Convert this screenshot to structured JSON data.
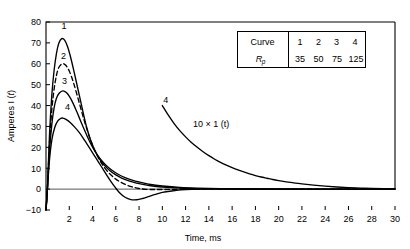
{
  "chart_data": {
    "type": "line",
    "title": "",
    "xlabel": "Time, ms",
    "ylabel": "Amperes I (t)",
    "xlim": [
      0,
      30
    ],
    "ylim": [
      -10,
      80
    ],
    "xticks": [
      2,
      4,
      6,
      8,
      10,
      12,
      14,
      16,
      18,
      20,
      22,
      24,
      26,
      28,
      30
    ],
    "yticks": [
      -10,
      0,
      10,
      20,
      30,
      40,
      50,
      60,
      70,
      80
    ],
    "grid": false,
    "legend": "none",
    "zero_line": true,
    "annotations": [
      {
        "name": "magnified-curve-label",
        "text": "4",
        "x": 10.3,
        "y": 41
      },
      {
        "name": "magnification-note",
        "text": "10 × 1 (t)",
        "x": 14.2,
        "y": 29.5
      }
    ],
    "series": [
      {
        "name": "1",
        "label": "1",
        "Rp": 35,
        "style": "solid",
        "label_x": 1.55,
        "label_y": 76.5,
        "peak_x": 1.35,
        "peak_y": 72,
        "points": [
          [
            0,
            -10
          ],
          [
            0.12,
            0
          ],
          [
            0.3,
            26
          ],
          [
            0.5,
            45
          ],
          [
            0.7,
            57
          ],
          [
            0.9,
            65
          ],
          [
            1.1,
            69.8
          ],
          [
            1.35,
            72
          ],
          [
            1.6,
            71.3
          ],
          [
            1.85,
            68.3
          ],
          [
            2.1,
            63.5
          ],
          [
            2.4,
            56.5
          ],
          [
            2.7,
            49
          ],
          [
            3.0,
            41.5
          ],
          [
            3.3,
            34
          ],
          [
            3.5,
            29.5
          ],
          [
            3.8,
            24
          ],
          [
            4.2,
            18.5
          ],
          [
            4.6,
            14.5
          ],
          [
            5.0,
            11.5
          ],
          [
            5.5,
            8.8
          ],
          [
            6.0,
            6.8
          ],
          [
            6.5,
            5.3
          ],
          [
            7.0,
            4.2
          ],
          [
            7.5,
            3.3
          ],
          [
            8.0,
            2.6
          ],
          [
            9.0,
            1.6
          ],
          [
            10.0,
            1.0
          ],
          [
            11.5,
            0.5
          ],
          [
            13.0,
            0.25
          ],
          [
            15.0,
            0.1
          ],
          [
            18.0,
            0.03
          ],
          [
            22.0,
            0
          ],
          [
            30.0,
            0
          ]
        ]
      },
      {
        "name": "2",
        "label": "2",
        "Rp": 50,
        "style": "dashed",
        "label_x": 1.5,
        "label_y": 62.5,
        "peak_x": 1.4,
        "peak_y": 60,
        "points": [
          [
            0,
            -10
          ],
          [
            0.12,
            0
          ],
          [
            0.3,
            22
          ],
          [
            0.5,
            38
          ],
          [
            0.7,
            48
          ],
          [
            0.9,
            54.5
          ],
          [
            1.1,
            58.2
          ],
          [
            1.4,
            60
          ],
          [
            1.7,
            59.3
          ],
          [
            2.0,
            56.5
          ],
          [
            2.3,
            52
          ],
          [
            2.6,
            46.5
          ],
          [
            2.9,
            40.5
          ],
          [
            3.2,
            34.5
          ],
          [
            3.5,
            29
          ],
          [
            3.8,
            24
          ],
          [
            4.2,
            18.5
          ],
          [
            4.6,
            14
          ],
          [
            5.0,
            10.5
          ],
          [
            5.5,
            7.2
          ],
          [
            6.0,
            4.8
          ],
          [
            6.5,
            3.1
          ],
          [
            7.0,
            1.8
          ],
          [
            7.5,
            0.9
          ],
          [
            8.0,
            0.3
          ],
          [
            8.6,
            -0.1
          ],
          [
            9.4,
            -0.2
          ],
          [
            10.5,
            -0.15
          ],
          [
            12.0,
            -0.05
          ],
          [
            14.0,
            0
          ],
          [
            20.0,
            0
          ],
          [
            30.0,
            0
          ]
        ]
      },
      {
        "name": "3",
        "label": "3",
        "Rp": 75,
        "style": "solid",
        "label_x": 1.6,
        "label_y": 50.5,
        "peak_x": 1.45,
        "peak_y": 47,
        "points": [
          [
            0,
            -10
          ],
          [
            0.12,
            0
          ],
          [
            0.3,
            18
          ],
          [
            0.5,
            31
          ],
          [
            0.7,
            39
          ],
          [
            0.9,
            43.5
          ],
          [
            1.15,
            46
          ],
          [
            1.45,
            47
          ],
          [
            1.75,
            46.2
          ],
          [
            2.05,
            44
          ],
          [
            2.35,
            40.8
          ],
          [
            2.65,
            37
          ],
          [
            2.95,
            33
          ],
          [
            3.25,
            29
          ],
          [
            3.55,
            25.2
          ],
          [
            3.9,
            21.2
          ],
          [
            4.3,
            17.3
          ],
          [
            4.7,
            14.2
          ],
          [
            5.2,
            11.2
          ],
          [
            5.7,
            8.9
          ],
          [
            6.2,
            7.1
          ],
          [
            6.8,
            5.5
          ],
          [
            7.4,
            4.3
          ],
          [
            8.0,
            3.4
          ],
          [
            9.0,
            2.2
          ],
          [
            10.0,
            1.5
          ],
          [
            11.5,
            0.8
          ],
          [
            13.0,
            0.45
          ],
          [
            15.0,
            0.2
          ],
          [
            18.0,
            0.06
          ],
          [
            22.0,
            0
          ],
          [
            30.0,
            0
          ]
        ]
      },
      {
        "name": "4",
        "label": "4",
        "Rp": 125,
        "style": "solid",
        "label_x": 1.85,
        "label_y": 38,
        "peak_x": 1.4,
        "peak_y": 34,
        "points": [
          [
            0,
            -10
          ],
          [
            0.12,
            0
          ],
          [
            0.3,
            14
          ],
          [
            0.5,
            23.5
          ],
          [
            0.75,
            29.5
          ],
          [
            1.0,
            32.5
          ],
          [
            1.25,
            33.8
          ],
          [
            1.45,
            34
          ],
          [
            1.75,
            33.3
          ],
          [
            2.1,
            31.8
          ],
          [
            2.45,
            29.8
          ],
          [
            2.8,
            27.5
          ],
          [
            3.15,
            24.8
          ],
          [
            3.5,
            21.8
          ],
          [
            3.9,
            18.3
          ],
          [
            4.3,
            14.8
          ],
          [
            4.7,
            11.3
          ],
          [
            5.1,
            7.8
          ],
          [
            5.5,
            4.3
          ],
          [
            5.9,
            1.2
          ],
          [
            6.3,
            -1.6
          ],
          [
            6.8,
            -3.9
          ],
          [
            7.3,
            -5.0
          ],
          [
            7.8,
            -5.1
          ],
          [
            8.3,
            -4.5
          ],
          [
            8.8,
            -3.6
          ],
          [
            9.4,
            -2.5
          ],
          [
            10.0,
            -1.6
          ],
          [
            10.8,
            -0.9
          ],
          [
            11.6,
            -0.4
          ],
          [
            12.5,
            -0.1
          ],
          [
            13.5,
            0
          ],
          [
            16.0,
            0
          ],
          [
            22.0,
            0
          ],
          [
            30.0,
            0
          ]
        ]
      },
      {
        "name": "4-magnified",
        "label": "4",
        "Rp": 125,
        "style": "solid",
        "scale": "10x",
        "points": [
          [
            10.0,
            40
          ],
          [
            10.5,
            35.5
          ],
          [
            11.0,
            31.5
          ],
          [
            11.5,
            28
          ],
          [
            12.0,
            25
          ],
          [
            12.5,
            22.3
          ],
          [
            13.0,
            20
          ],
          [
            13.5,
            17.9
          ],
          [
            14.0,
            16.0
          ],
          [
            14.5,
            14.3
          ],
          [
            15.0,
            12.8
          ],
          [
            15.5,
            11.5
          ],
          [
            16.0,
            10.3
          ],
          [
            16.5,
            9.2
          ],
          [
            17.0,
            8.2
          ],
          [
            17.5,
            7.3
          ],
          [
            18.0,
            6.5
          ],
          [
            18.5,
            5.8
          ],
          [
            19.0,
            5.2
          ],
          [
            19.5,
            4.6
          ],
          [
            20.0,
            4.1
          ],
          [
            21.0,
            3.2
          ],
          [
            22.0,
            2.5
          ],
          [
            23.0,
            1.9
          ],
          [
            24.0,
            1.4
          ],
          [
            25.0,
            1.0
          ],
          [
            26.0,
            0.7
          ],
          [
            27.0,
            0.5
          ],
          [
            28.0,
            0.3
          ],
          [
            29.0,
            0.15
          ],
          [
            30.0,
            0.05
          ]
        ]
      }
    ]
  },
  "table": {
    "row_labels": [
      "Curve",
      "R"
    ],
    "subscript": "p",
    "curves": [
      "1",
      "2",
      "3",
      "4"
    ],
    "rp_values": [
      "35",
      "50",
      "75",
      "125"
    ]
  },
  "axes": {
    "y_label_main": "Amperes I (",
    "y_label_italic": "t",
    "y_label_end": ")",
    "x_label": "Time, ms"
  },
  "colors": {
    "curve": "#000000",
    "axis": "#000000",
    "zero_line": "#555555",
    "background": "#ffffff"
  }
}
